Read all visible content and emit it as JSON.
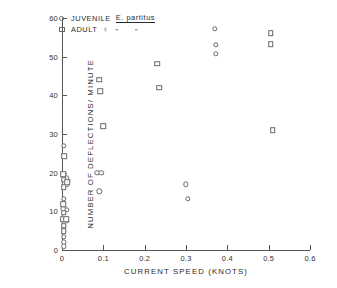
{
  "chart_data": {
    "type": "scatter",
    "title": "",
    "xlabel": "CURRENT SPEED (KNOTS)",
    "ylabel": "NUMBER OF DEFLECTIONS/ MINUTE",
    "xlim": [
      0,
      0.6
    ],
    "ylim": [
      0,
      60
    ],
    "xticks": [
      0,
      0.1,
      0.2,
      0.3,
      0.4,
      0.5,
      0.6
    ],
    "xticklabels": [
      "0",
      "0.1",
      "0.2",
      "0.3",
      "0.4",
      "0.5",
      "0.6"
    ],
    "yticks": [
      0,
      10,
      20,
      30,
      40,
      50,
      60
    ],
    "yticklabels": [
      "0",
      "10",
      "20",
      "30",
      "40",
      "50",
      "60"
    ],
    "grid": false,
    "legend_position": "upper-left",
    "series": [
      {
        "name": "JUVENILE",
        "marker": "circle",
        "color": "#6a6a6a",
        "points": [
          [
            0.005,
            27.0
          ],
          [
            0.004,
            19.3
          ],
          [
            0.01,
            18.6
          ],
          [
            0.012,
            17.0
          ],
          [
            0.004,
            13.3
          ],
          [
            0.003,
            10.6
          ],
          [
            0.012,
            10.4
          ],
          [
            0.003,
            8.0
          ],
          [
            0.011,
            7.6
          ],
          [
            0.004,
            6.3
          ],
          [
            0.004,
            4.8
          ],
          [
            0.004,
            3.4
          ],
          [
            0.004,
            2.0
          ],
          [
            0.004,
            1.0
          ],
          [
            0.085,
            20.0
          ],
          [
            0.095,
            20.0
          ],
          [
            0.09,
            15.2
          ],
          [
            0.3,
            17.0
          ],
          [
            0.305,
            13.2
          ],
          [
            0.37,
            57.2
          ],
          [
            0.372,
            53.0
          ],
          [
            0.372,
            50.8
          ]
        ]
      },
      {
        "name": "ADULT",
        "marker": "square",
        "color": "#6a6a6a",
        "points": [
          [
            0.005,
            24.3
          ],
          [
            0.003,
            19.6
          ],
          [
            0.004,
            18.2
          ],
          [
            0.013,
            17.6
          ],
          [
            0.004,
            16.2
          ],
          [
            0.003,
            11.8
          ],
          [
            0.004,
            9.6
          ],
          [
            0.003,
            8.0
          ],
          [
            0.01,
            8.0
          ],
          [
            0.004,
            6.3
          ],
          [
            0.004,
            4.8
          ],
          [
            0.09,
            44.0
          ],
          [
            0.092,
            41.0
          ],
          [
            0.1,
            32.0
          ],
          [
            0.23,
            48.2
          ],
          [
            0.235,
            42.0
          ],
          [
            0.505,
            56.0
          ],
          [
            0.505,
            53.2
          ],
          [
            0.51,
            31.0
          ]
        ]
      }
    ]
  },
  "legend": {
    "juvenile": {
      "label": "JUVENILE",
      "species_abbrev": "E.",
      "species_name": "partitus",
      "marker": "circle"
    },
    "adult": {
      "label": "ADULT",
      "symbol": "♀",
      "ditto_mark_1": "\"",
      "ditto_mark_2": "\"",
      "marker": "square"
    }
  }
}
